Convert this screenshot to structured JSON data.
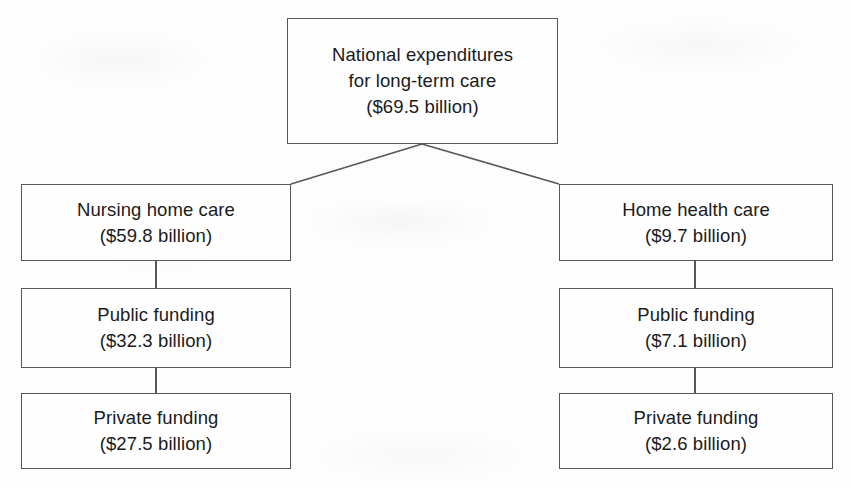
{
  "diagram": {
    "type": "hierarchy-tree",
    "orientation": "top-down",
    "levels": 3,
    "node_count": 7,
    "colors": {
      "box_border": "#58585a",
      "connector": "#58585a",
      "text": "#1b1b1b",
      "background": "#fdfdfd"
    },
    "root": {
      "id": "national-expenditures",
      "line1": "National expenditures",
      "line2": "for long-term care",
      "amount": "($69.5 billion)",
      "value": 69.5,
      "unit": "billion USD"
    },
    "branches": [
      {
        "id": "nursing-home-care",
        "label": "Nursing home care",
        "amount": "($59.8 billion)",
        "value": 59.8,
        "unit": "billion USD",
        "children": [
          {
            "id": "nursing-public-funding",
            "label": "Public funding",
            "amount": "($32.3 billion)",
            "value": 32.3,
            "unit": "billion USD"
          },
          {
            "id": "nursing-private-funding",
            "label": "Private funding",
            "amount": "($27.5 billion)",
            "value": 27.5,
            "unit": "billion USD"
          }
        ]
      },
      {
        "id": "home-health-care",
        "label": "Home health care",
        "amount": "($9.7 billion)",
        "value": 9.7,
        "unit": "billion USD",
        "children": [
          {
            "id": "home-public-funding",
            "label": "Public funding",
            "amount": "($7.1 billion)",
            "value": 7.1,
            "unit": "billion USD"
          },
          {
            "id": "home-private-funding",
            "label": "Private funding",
            "amount": "($2.6 billion)",
            "value": 2.6,
            "unit": "billion USD"
          }
        ]
      }
    ]
  }
}
